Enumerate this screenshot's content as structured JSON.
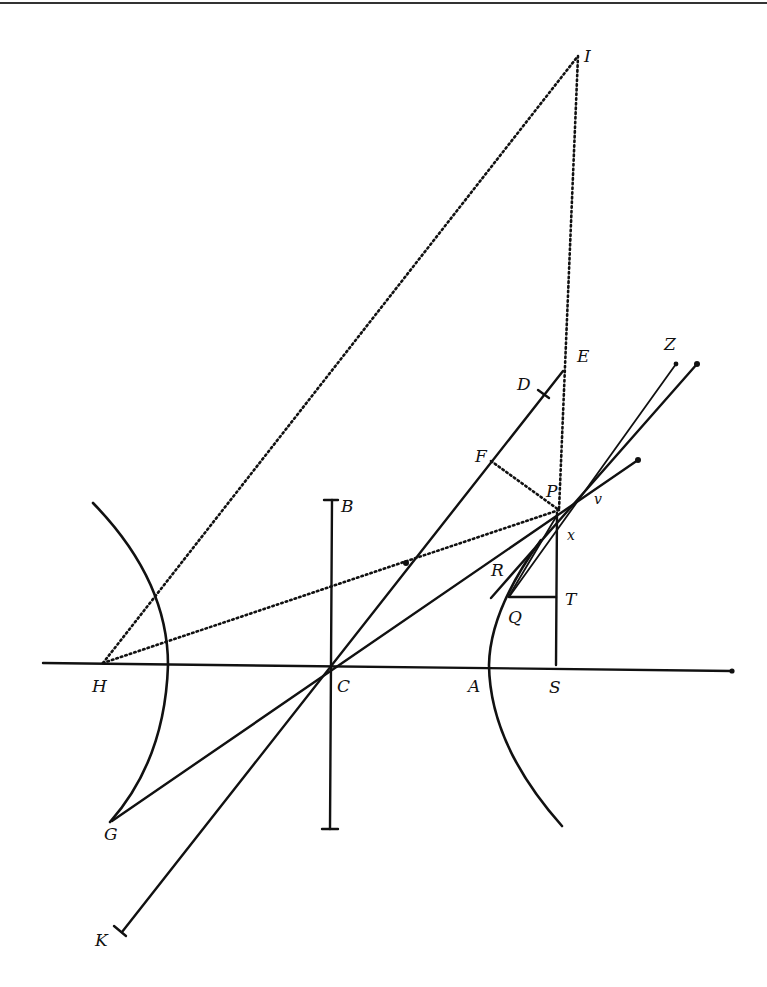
{
  "figure": {
    "points": {
      "I": {
        "label": "I",
        "x": 578,
        "y": 56
      },
      "E": {
        "label": "E",
        "x": 565,
        "y": 371
      },
      "D": {
        "label": "D",
        "x": 541,
        "y": 394
      },
      "Z": {
        "label": "Z",
        "x": 676,
        "y": 363
      },
      "F": {
        "label": "F",
        "x": 491,
        "y": 461
      },
      "P": {
        "label": "P",
        "x": 559,
        "y": 510
      },
      "v": {
        "label": "v",
        "x": 590,
        "y": 495
      },
      "x": {
        "label": "x",
        "x": 560,
        "y": 533
      },
      "B": {
        "label": "B",
        "x": 332,
        "y": 502
      },
      "R": {
        "label": "R",
        "x": 509,
        "y": 592
      },
      "Q": {
        "label": "Q",
        "x": 509,
        "y": 597
      },
      "T": {
        "label": "T",
        "x": 556,
        "y": 597
      },
      "H": {
        "label": "H",
        "x": 103,
        "y": 663
      },
      "C": {
        "label": "C",
        "x": 330,
        "y": 664
      },
      "A": {
        "label": "A",
        "x": 489,
        "y": 665
      },
      "S": {
        "label": "S",
        "x": 556,
        "y": 665
      },
      "G": {
        "label": "G",
        "x": 110,
        "y": 822
      },
      "K": {
        "label": "K",
        "x": 120,
        "y": 937
      }
    },
    "label_positions": {
      "I": [
        584,
        62
      ],
      "E": [
        577,
        362
      ],
      "D": [
        517,
        390
      ],
      "Z": [
        664,
        350
      ],
      "F": [
        475,
        462
      ],
      "P": [
        572,
        491
      ],
      "v": [
        592,
        509
      ],
      "x": [
        566,
        541
      ],
      "B": [
        341,
        512
      ],
      "R": [
        490,
        576
      ],
      "Q": [
        507,
        624
      ],
      "T": [
        564,
        605
      ],
      "H": [
        92,
        693
      ],
      "C": [
        337,
        693
      ],
      "A": [
        468,
        693
      ],
      "S": [
        549,
        695
      ],
      "G": [
        103,
        841
      ],
      "K": [
        94,
        947
      ]
    }
  }
}
